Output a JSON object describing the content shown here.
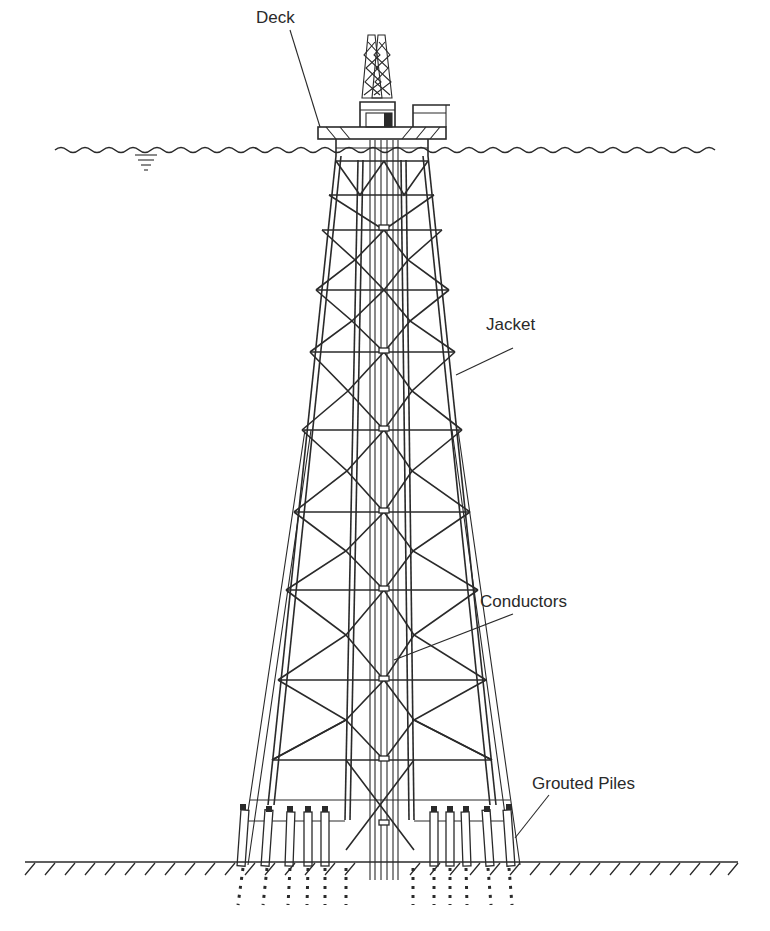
{
  "figure": {
    "labels": {
      "deck": "Deck",
      "jacket": "Jacket",
      "conductors": "Conductors",
      "grouted_piles": "Grouted Piles"
    },
    "components": [
      "derrick",
      "deck",
      "water-surface",
      "jacket-legs",
      "x-bracing",
      "conductors",
      "pile-sleeves",
      "grouted-piles",
      "seabed"
    ],
    "colors": {
      "line": "#2a2a2a",
      "background": "#ffffff"
    }
  }
}
